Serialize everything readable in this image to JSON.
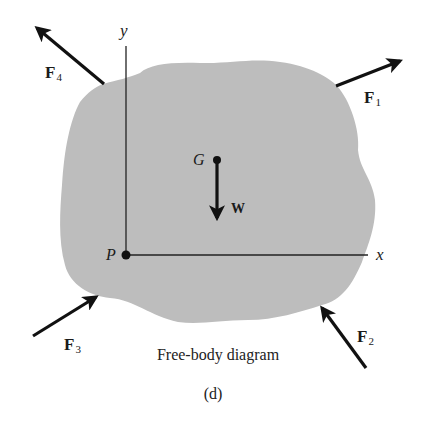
{
  "diagram": {
    "caption": "Free-body diagram",
    "sublabel": "(d)",
    "body_color": "#bdbdbd",
    "ink_color": "#111111",
    "axes": {
      "x_label": "x",
      "y_label": "y",
      "origin_label": "P"
    },
    "center_of_gravity": {
      "label": "G",
      "weight_label": "W"
    },
    "forces": [
      {
        "name": "F",
        "subscript": "1"
      },
      {
        "name": "F",
        "subscript": "2"
      },
      {
        "name": "F",
        "subscript": "3"
      },
      {
        "name": "F",
        "subscript": "4"
      }
    ]
  }
}
